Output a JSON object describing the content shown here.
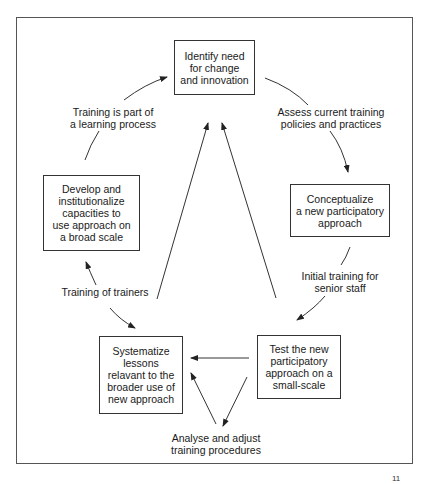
{
  "diagram": {
    "type": "cycle-flowchart",
    "nodes": [
      {
        "id": "identify",
        "label": "Identify need\nfor change\nand innovation"
      },
      {
        "id": "conceptualize",
        "label": "Conceptualize\na new participatory\napproach"
      },
      {
        "id": "test",
        "label": "Test the new\nparticipatory\napproach on a\nsmall-scale"
      },
      {
        "id": "systematize",
        "label": "Systematize\nlessons\nrelavant to the\nbroader use of\nnew approach"
      },
      {
        "id": "develop",
        "label": "Develop and\ninstitutionalize\ncapacities to\nuse approach on\na broad scale"
      }
    ],
    "edge_labels": {
      "assess": "Assess current training\npolicies and practices",
      "initial": "Initial training for\nsenior staff",
      "analyse": "Analyse and adjust\ntraining procedures",
      "trainers": "Training of trainers",
      "learning": "Training is part of\na learning process"
    },
    "edges": [
      {
        "from": "identify",
        "to": "conceptualize",
        "label": "assess"
      },
      {
        "from": "conceptualize",
        "to": "test",
        "label": "initial"
      },
      {
        "from": "test",
        "to": "systematize"
      },
      {
        "from": "test",
        "to": "analyse-node",
        "label": "analyse"
      },
      {
        "from": "analyse-node",
        "to": "systematize"
      },
      {
        "from": "systematize",
        "to": "develop",
        "label": "trainers"
      },
      {
        "from": "develop",
        "to": "identify",
        "label": "learning"
      },
      {
        "from": "systematize",
        "to": "identify"
      },
      {
        "from": "test",
        "to": "identify"
      }
    ],
    "corner_mark": "11"
  }
}
